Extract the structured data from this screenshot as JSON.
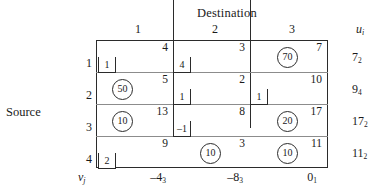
{
  "labels": {
    "destination_title": "Destination",
    "source_title": "Source",
    "ui_header": "u",
    "ui_header_sub": "i",
    "vj_header": "v",
    "vj_header_sub": "j"
  },
  "column_headers": [
    "1",
    "2",
    "3"
  ],
  "row_headers": [
    "1",
    "2",
    "3",
    "4"
  ],
  "cells": [
    [
      {
        "cost": "4",
        "alloc": null,
        "eval": "1",
        "eval_pos": "left"
      },
      {
        "cost": "3",
        "alloc": null,
        "eval": "4",
        "eval_pos": "center"
      },
      {
        "cost": "7",
        "alloc": "70",
        "eval": null,
        "eval_pos": null
      }
    ],
    [
      {
        "cost": "5",
        "alloc": "50",
        "eval": null,
        "eval_pos": null
      },
      {
        "cost": "2",
        "alloc": null,
        "eval": "1",
        "eval_pos": "center"
      },
      {
        "cost": "10",
        "alloc": null,
        "eval": "1",
        "eval_pos": "center"
      }
    ],
    [
      {
        "cost": "13",
        "alloc": "10",
        "eval": null,
        "eval_pos": null
      },
      {
        "cost": "8",
        "alloc": null,
        "eval": "–1",
        "eval_pos": "center"
      },
      {
        "cost": "17",
        "alloc": "20",
        "eval": null,
        "eval_pos": null
      }
    ],
    [
      {
        "cost": "9",
        "alloc": null,
        "eval": "2",
        "eval_pos": "left"
      },
      {
        "cost": "3",
        "alloc": "10",
        "eval": null,
        "eval_pos": null
      },
      {
        "cost": "11",
        "alloc": "10",
        "eval": null,
        "eval_pos": null
      }
    ]
  ],
  "u_values": [
    {
      "value": "7",
      "sub": "2"
    },
    {
      "value": "9",
      "sub": "4"
    },
    {
      "value": "17",
      "sub": "2"
    },
    {
      "value": "11",
      "sub": "2"
    }
  ],
  "v_values": [
    {
      "value": "–4",
      "sub": "3"
    },
    {
      "value": "–8",
      "sub": "3"
    },
    {
      "value": "0",
      "sub": "1"
    }
  ],
  "colors": {
    "ink": "#1a1a1a",
    "frame": "#2b2b2b",
    "rule": "#8c8c8c",
    "paper": "#ffffff"
  }
}
